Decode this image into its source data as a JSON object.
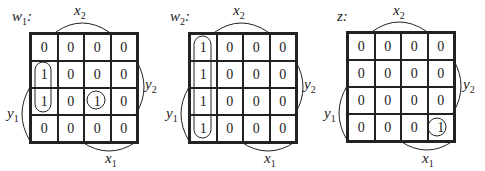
{
  "maps": [
    {
      "id": "w1",
      "title": "w",
      "title_sub": "1",
      "title_suffix": ":",
      "rows": [
        [
          "0",
          "0",
          "0",
          "0"
        ],
        [
          "1",
          "0",
          "0",
          "0"
        ],
        [
          "1",
          "0",
          "1",
          "0"
        ],
        [
          "0",
          "0",
          "0",
          "0"
        ]
      ],
      "groups": [
        {
          "type": "vertical-loop",
          "col": 0,
          "rows": [
            1,
            2
          ]
        },
        {
          "type": "circle",
          "col": 2,
          "row": 2
        }
      ]
    },
    {
      "id": "w2",
      "title": "w",
      "title_sub": "2",
      "title_suffix": ":",
      "rows": [
        [
          "1",
          "0",
          "0",
          "0"
        ],
        [
          "1",
          "0",
          "0",
          "0"
        ],
        [
          "1",
          "0",
          "0",
          "0"
        ],
        [
          "1",
          "0",
          "0",
          "0"
        ]
      ],
      "groups": [
        {
          "type": "vertical-loop",
          "col": 0,
          "rows": [
            0,
            3
          ]
        }
      ]
    },
    {
      "id": "z",
      "title": "z",
      "title_sub": "",
      "title_suffix": ":",
      "rows": [
        [
          "0",
          "0",
          "0",
          "0"
        ],
        [
          "0",
          "0",
          "0",
          "0"
        ],
        [
          "0",
          "0",
          "0",
          "0"
        ],
        [
          "0",
          "0",
          "0",
          "1"
        ]
      ],
      "groups": [
        {
          "type": "circle",
          "col": 3,
          "row": 3
        }
      ]
    }
  ],
  "axis_labels": {
    "x2": {
      "var": "x",
      "sub": "2"
    },
    "x1": {
      "var": "x",
      "sub": "1"
    },
    "y2": {
      "var": "y",
      "sub": "2"
    },
    "y1": {
      "var": "y",
      "sub": "1"
    }
  }
}
